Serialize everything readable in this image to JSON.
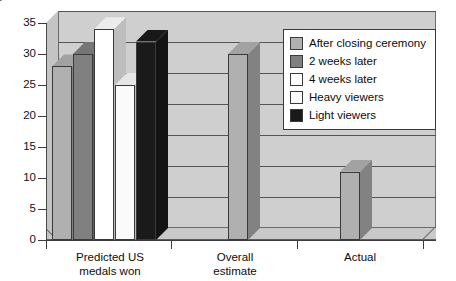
{
  "chart_data": {
    "type": "bar",
    "title": "",
    "subtitle": "",
    "xlabel": "",
    "ylabel": "",
    "ylim": [
      0,
      35
    ],
    "ytick_step": 5,
    "yticks": [
      0,
      5,
      10,
      15,
      20,
      25,
      30,
      35
    ],
    "ytick_labels": [
      "0",
      "5",
      "10",
      "15",
      "20",
      "25",
      "30",
      "35"
    ],
    "grid": true,
    "grid_axis": "y",
    "legend_position": "top-right",
    "style": "3d-grouped-bar",
    "categories": [
      "Predicted US medals won",
      "Overall estimate",
      "Actual"
    ],
    "category_lines": [
      [
        "Predicted US",
        "medals won"
      ],
      [
        "Overall",
        "estimate"
      ],
      [
        "Actual"
      ]
    ],
    "series": [
      {
        "name": "After closing ceremony",
        "color": "#b0b0b0",
        "values": [
          28,
          null,
          null
        ]
      },
      {
        "name": "2 weeks later",
        "color": "#808080",
        "values": [
          30,
          null,
          null
        ]
      },
      {
        "name": "4 weeks later",
        "color": "#ffffff",
        "values": [
          34,
          null,
          null
        ]
      },
      {
        "name": "Heavy viewers",
        "color": "#fafafa",
        "values": [
          25,
          null,
          null
        ]
      },
      {
        "name": "Light viewers",
        "color": "#1a1a1a",
        "values": [
          32,
          null,
          null
        ]
      },
      {
        "name": "Overall estimate bar",
        "color": "#b0b0b0",
        "values": [
          null,
          30,
          null
        ]
      },
      {
        "name": "Actual bar",
        "color": "#b0b0b0",
        "values": [
          null,
          null,
          11
        ]
      }
    ],
    "bars": [
      {
        "label": "After closing ceremony",
        "category": "Predicted US medals won",
        "value": 28,
        "color": "#b0b0b0"
      },
      {
        "label": "2 weeks later",
        "category": "Predicted US medals won",
        "value": 30,
        "color": "#808080"
      },
      {
        "label": "4 weeks later",
        "category": "Predicted US medals won",
        "value": 34,
        "color": "#ffffff"
      },
      {
        "label": "Heavy viewers",
        "category": "Predicted US medals won",
        "value": 25,
        "color": "#fafafa"
      },
      {
        "label": "Light viewers",
        "category": "Predicted US medals won",
        "value": 32,
        "color": "#1a1a1a"
      },
      {
        "label": "Overall estimate",
        "category": "Overall estimate",
        "value": 30,
        "color": "#b0b0b0"
      },
      {
        "label": "Actual",
        "category": "Actual",
        "value": 11,
        "color": "#b0b0b0"
      }
    ]
  },
  "legend": {
    "items": [
      {
        "label": "After closing ceremony",
        "color": "#b0b0b0"
      },
      {
        "label": "2 weeks later",
        "color": "#808080"
      },
      {
        "label": "4 weeks later",
        "color": "#ffffff"
      },
      {
        "label": "Heavy viewers",
        "color": "#fafafa"
      },
      {
        "label": "Light viewers",
        "color": "#1a1a1a"
      }
    ]
  },
  "axis": {
    "y_labels": [
      "35",
      "30",
      "25",
      "20",
      "15",
      "10",
      "5",
      "0"
    ],
    "x_labels": [
      {
        "line1": "Predicted US",
        "line2": "medals won"
      },
      {
        "line1": "Overall",
        "line2": "estimate"
      },
      {
        "line1": "Actual",
        "line2": ""
      }
    ]
  },
  "colors": {
    "plot_background": "#cfcfcf",
    "floor": "#c9c9c9",
    "gridline": "#555555",
    "axis": "#3b3b3b",
    "page_background": "#ffffff",
    "text": "#0d0d0d"
  }
}
